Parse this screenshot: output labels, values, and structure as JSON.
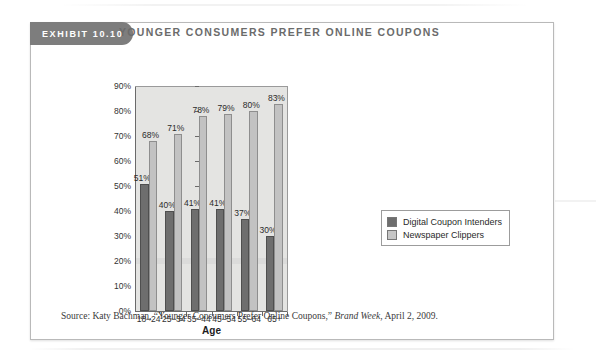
{
  "exhibit": {
    "tab_label": "EXHIBIT  10.10",
    "title": "YOUNGER CONSUMERS PREFER ONLINE COUPONS"
  },
  "source": {
    "prefix": "Source: Katy Bachman, “Younger Consumers Prefer Online Coupons,” ",
    "publication": "Brand Week",
    "suffix": ", April 2, 2009."
  },
  "colors": {
    "series_dark": "#6e6e6e",
    "series_light": "#c2c2c2",
    "plot_background": "#e4e4e2",
    "tab_background": "#7d7d7d",
    "title_text": "#6b6b6b"
  },
  "chart_data": {
    "type": "bar",
    "title": "YOUNGER CONSUMERS PREFER ONLINE COUPONS",
    "xlabel": "Age",
    "ylabel": "",
    "ylim": [
      0,
      90
    ],
    "ytick_values": [
      0,
      10,
      20,
      30,
      40,
      50,
      60,
      70,
      80,
      90
    ],
    "ytick_labels": [
      "0%",
      "10%",
      "20%",
      "30%",
      "40%",
      "50%",
      "60%",
      "70%",
      "80%",
      "90%"
    ],
    "grid": false,
    "legend_position": "right",
    "categories": [
      "18–24",
      "25–34",
      "35–44",
      "45–54",
      "55–64",
      "65+"
    ],
    "series": [
      {
        "name": "Digital Coupon Intenders",
        "color": "#6e6e6e",
        "values": [
          51,
          40,
          41,
          41,
          37,
          30
        ],
        "labels": [
          "51%",
          "40%",
          "41%",
          "41%",
          "37%",
          "30%"
        ]
      },
      {
        "name": "Newspaper Clippers",
        "color": "#c2c2c2",
        "values": [
          68,
          71,
          78,
          79,
          80,
          83
        ],
        "labels": [
          "68%",
          "71%",
          "78%",
          "79%",
          "80%",
          "83%"
        ]
      }
    ]
  }
}
